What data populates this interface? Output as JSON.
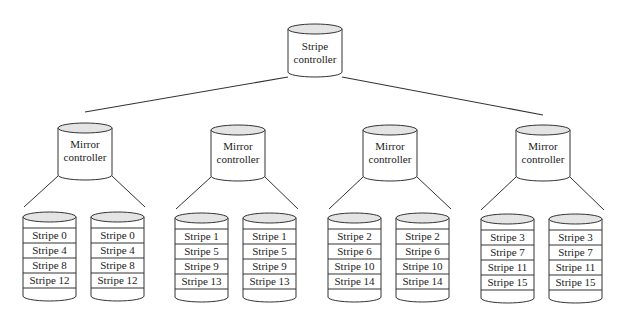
{
  "diagram": {
    "type": "RAID 1+0 hierarchy (stripe over mirrors)",
    "colors": {
      "stroke": "#333333",
      "cylinder_top": "#e4e4e4",
      "background": "#ffffff"
    },
    "root": {
      "label_line1": "Stripe",
      "label_line2": "controller"
    },
    "mirrors": [
      {
        "label_line1": "Mirror",
        "label_line2": "controller",
        "disks": [
          {
            "stripes": [
              "Stripe 0",
              "Stripe 4",
              "Stripe 8",
              "Stripe 12"
            ]
          },
          {
            "stripes": [
              "Stripe 0",
              "Stripe 4",
              "Stripe 8",
              "Stripe 12"
            ]
          }
        ]
      },
      {
        "label_line1": "Mirror",
        "label_line2": "controller",
        "disks": [
          {
            "stripes": [
              "Stripe 1",
              "Stripe 5",
              "Stripe 9",
              "Stripe 13"
            ]
          },
          {
            "stripes": [
              "Stripe 1",
              "Stripe 5",
              "Stripe 9",
              "Stripe 13"
            ]
          }
        ]
      },
      {
        "label_line1": "Mirror",
        "label_line2": "controller",
        "disks": [
          {
            "stripes": [
              "Stripe 2",
              "Stripe 6",
              "Stripe 10",
              "Stripe 14"
            ]
          },
          {
            "stripes": [
              "Stripe 2",
              "Stripe 6",
              "Stripe 10",
              "Stripe 14"
            ]
          }
        ]
      },
      {
        "label_line1": "Mirror",
        "label_line2": "controller",
        "disks": [
          {
            "stripes": [
              "Stripe 3",
              "Stripe 7",
              "Stripe 11",
              "Stripe 15"
            ]
          },
          {
            "stripes": [
              "Stripe 3",
              "Stripe 7",
              "Stripe 11",
              "Stripe 15"
            ]
          }
        ]
      }
    ]
  }
}
